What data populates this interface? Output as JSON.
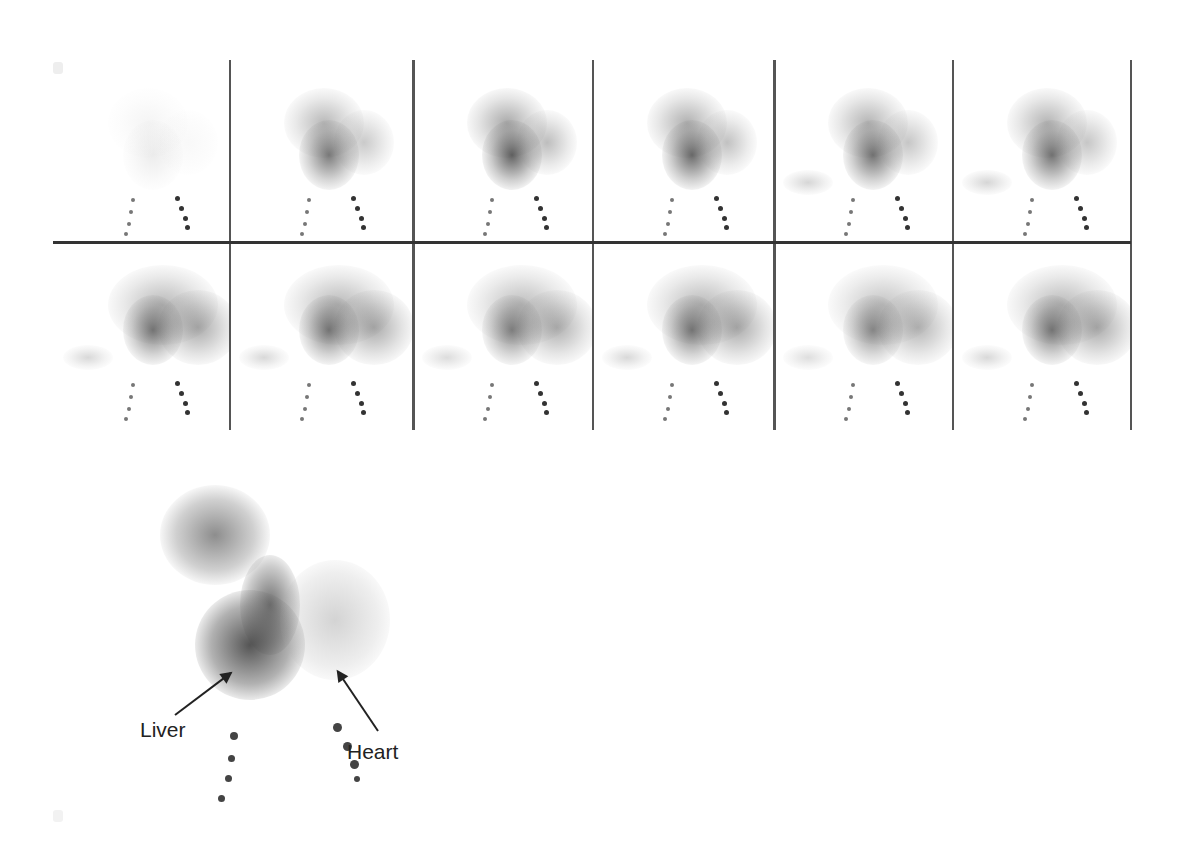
{
  "figure": {
    "type": "scintigraphy-frame-sequence",
    "grid": {
      "rows": 2,
      "columns": 6,
      "frames": [
        {
          "index": 1,
          "row": 1,
          "col": 1,
          "intensity": 0.1
        },
        {
          "index": 2,
          "row": 1,
          "col": 2,
          "intensity": 0.75
        },
        {
          "index": 3,
          "row": 1,
          "col": 3,
          "intensity": 0.9
        },
        {
          "index": 4,
          "row": 1,
          "col": 4,
          "intensity": 0.85
        },
        {
          "index": 5,
          "row": 1,
          "col": 5,
          "intensity": 0.8
        },
        {
          "index": 6,
          "row": 1,
          "col": 6,
          "intensity": 0.8
        },
        {
          "index": 7,
          "row": 2,
          "col": 1,
          "intensity": 0.75
        },
        {
          "index": 8,
          "row": 2,
          "col": 2,
          "intensity": 0.75
        },
        {
          "index": 9,
          "row": 2,
          "col": 3,
          "intensity": 0.7
        },
        {
          "index": 10,
          "row": 2,
          "col": 4,
          "intensity": 0.75
        },
        {
          "index": 11,
          "row": 2,
          "col": 5,
          "intensity": 0.65
        },
        {
          "index": 12,
          "row": 2,
          "col": 6,
          "intensity": 0.75
        }
      ]
    },
    "enlarged_frame": {
      "annotations": [
        {
          "label": "Liver",
          "target": "liver-region"
        },
        {
          "label": "Heart",
          "target": "heart-region"
        }
      ]
    }
  },
  "labels": {
    "liver": "Liver",
    "heart": "Heart"
  },
  "colors": {
    "background": "#ffffff",
    "grid_line": "#555555",
    "tracer": "#333333"
  }
}
